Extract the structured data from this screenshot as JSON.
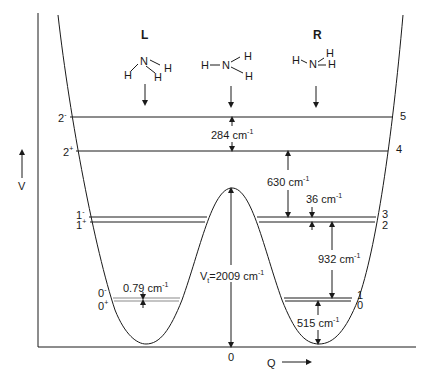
{
  "diagram": {
    "axes": {
      "y_label": "V",
      "x_label": "Q",
      "origin_label": "0"
    },
    "wells": {
      "left": {
        "label": "L"
      },
      "right": {
        "label": "R"
      }
    },
    "molecules": {
      "left": {
        "atoms": [
          "H",
          "N",
          "H",
          "H"
        ]
      },
      "center": {
        "atoms": [
          "H",
          "N",
          "H",
          "H"
        ]
      },
      "right": {
        "atoms": [
          "H",
          "N",
          "H",
          "H"
        ]
      }
    },
    "levels_left": [
      {
        "base": "2",
        "sup": "-"
      },
      {
        "base": "2",
        "sup": "+"
      },
      {
        "base": "1",
        "sup": "-"
      },
      {
        "base": "1",
        "sup": "+"
      },
      {
        "base": "0",
        "sup": "-"
      },
      {
        "base": "0",
        "sup": "+"
      }
    ],
    "levels_right": [
      "5",
      "4",
      "3",
      "2",
      "1",
      "0"
    ],
    "annotations": {
      "gap_284": {
        "value": "284",
        "unit": "cm",
        "exp": "-1"
      },
      "gap_630": {
        "value": "630",
        "unit": "cm",
        "exp": "-1"
      },
      "gap_36": {
        "value": "36",
        "unit": "cm",
        "exp": "-1"
      },
      "gap_932": {
        "value": "932",
        "unit": "cm",
        "exp": "-1"
      },
      "gap_515": {
        "value": "515",
        "unit": "cm",
        "exp": "-1"
      },
      "gap_079": {
        "value": "0.79",
        "unit": "cm",
        "exp": "-1"
      },
      "barrier": {
        "prefix": "V",
        "sub": "t",
        "value": "=2009",
        "unit": "cm",
        "exp": "-1"
      }
    },
    "colors": {
      "line": "#1a1a1a",
      "doublet": "#8a8a8a",
      "background": "#ffffff"
    }
  }
}
